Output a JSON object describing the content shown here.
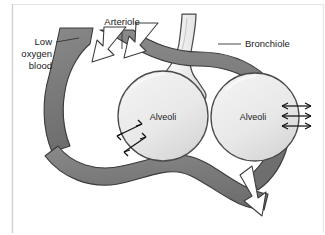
{
  "figure": {
    "title_alt": "Gas exchange at the alveoli",
    "background_color": "#ffffff",
    "frame_line_color": "#cfcfcf"
  },
  "labels": {
    "arteriole": "Arteriole",
    "bronchiole": "Bronchiole",
    "low_oxygen_blood_line1": "Low",
    "low_oxygen_blood_line2": "oxygen",
    "low_oxygen_blood_line3": "blood",
    "alveoli_left": "Alveoli",
    "alveoli_right": "Alveoli"
  },
  "colors": {
    "vessel_fill": "#7c7c7c",
    "vessel_stroke": "#3a3a3a",
    "alveolus_fill": "#e9e9e9",
    "alveolus_stroke": "#4a4a4a",
    "bronchiole_fill": "#f2f2f2",
    "bronchiole_stroke": "#4a4a4a",
    "flow_arrow_fill": "#ffffff",
    "flow_arrow_stroke": "#333333",
    "exchange_arrow": "#111111",
    "text": "#1a1a1a"
  },
  "icons": {
    "flow_arrow_top_outer": "white-flow-arrow-down-left",
    "flow_arrow_top_inner": "white-flow-arrow-down-left",
    "flow_arrow_bottom": "white-flow-arrow-down",
    "exchange_arrows_left": "double-headed-diffusion-arrow",
    "exchange_arrows_right": "double-headed-diffusion-arrow"
  },
  "counts": {
    "alveoli": 2,
    "left_exchange_arrows": 2,
    "right_exchange_arrows": 3,
    "flow_arrows": 3
  }
}
